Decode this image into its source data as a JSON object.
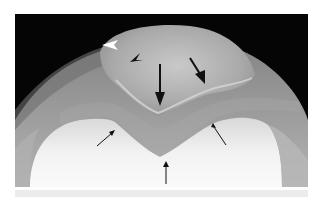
{
  "image": {
    "subject": "knee radiograph, axial patellar (skyline) view",
    "background_color": "#050505",
    "strip_color": "#ececec"
  },
  "annotations": [
    {
      "kind": "arrowhead",
      "color": "white",
      "x": 115,
      "y": 44,
      "direction": "left"
    },
    {
      "kind": "arrowhead",
      "color": "black",
      "x": 135,
      "y": 58,
      "direction": "down-left"
    },
    {
      "kind": "large-arrow",
      "color": "black",
      "from": [
        160,
        64
      ],
      "to": [
        159,
        104
      ]
    },
    {
      "kind": "large-arrow",
      "color": "black",
      "from": [
        190,
        60
      ],
      "to": [
        204,
        82
      ]
    },
    {
      "kind": "small-arrow",
      "color": "black",
      "from": [
        97,
        146
      ],
      "to": [
        115,
        130
      ]
    },
    {
      "kind": "small-arrow",
      "color": "black",
      "from": [
        225,
        145
      ],
      "to": [
        212,
        124
      ]
    },
    {
      "kind": "small-arrow",
      "color": "black",
      "from": [
        166,
        183
      ],
      "to": [
        166,
        163
      ]
    }
  ]
}
